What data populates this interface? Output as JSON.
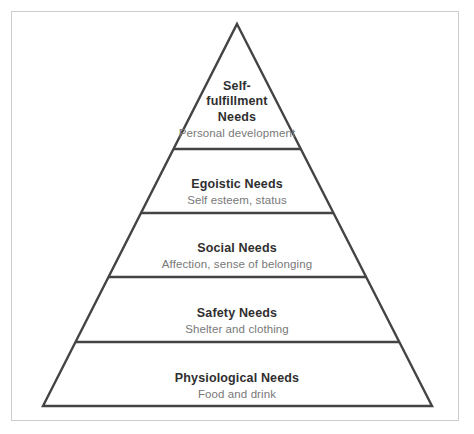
{
  "diagram": {
    "type": "pyramid",
    "name": "Maslow's Hierarchy of Needs",
    "background_color": "#ffffff",
    "frame_color": "#cccccc",
    "stroke_color": "#444444",
    "title_color": "#2f2f2f",
    "subtitle_color": "#787878",
    "apex": {
      "x": 237,
      "y": 24
    },
    "base_left": {
      "x": 43,
      "y": 406
    },
    "base_right": {
      "x": 432,
      "y": 406
    },
    "divider_y": [
      149,
      213,
      277,
      342
    ],
    "tiers": [
      {
        "level": 5,
        "position": "top",
        "title": "Self-\nfulfillment\nNeeds",
        "subtitle": "Personal development"
      },
      {
        "level": 4,
        "position": "upper-middle",
        "title": "Egoistic Needs",
        "subtitle": "Self esteem, status"
      },
      {
        "level": 3,
        "position": "middle",
        "title": "Social Needs",
        "subtitle": "Affection, sense of belonging"
      },
      {
        "level": 2,
        "position": "lower-middle",
        "title": "Safety Needs",
        "subtitle": "Shelter and clothing"
      },
      {
        "level": 1,
        "position": "base",
        "title": "Physiological Needs",
        "subtitle": "Food and drink"
      }
    ]
  }
}
